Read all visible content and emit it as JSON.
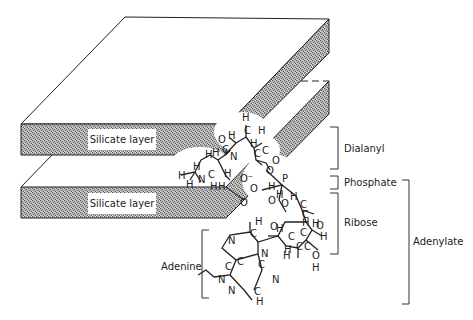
{
  "figure": {
    "type": "diagram"
  },
  "layers": [
    {
      "label": "Silicate layer",
      "position": "upper"
    },
    {
      "label": "Silicate layer",
      "position": "lower"
    }
  ],
  "brackets": [
    {
      "label": "Dialanyl"
    },
    {
      "label": "Phosphate"
    },
    {
      "label": "Ribose"
    },
    {
      "label": "Adenylate"
    },
    {
      "label": "Adenine"
    }
  ],
  "atoms": {
    "C": "C",
    "H": "H",
    "O": "O",
    "N": "N",
    "P": "P",
    "O_minus": "O⁻"
  },
  "colors": {
    "line": "#222222",
    "shade": "#9a9a9a",
    "background": "#ffffff"
  }
}
